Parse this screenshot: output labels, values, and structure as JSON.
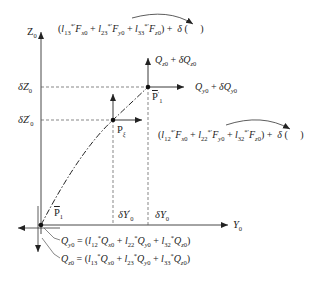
{
  "axes": {
    "vertical_label": "Z",
    "vertical_sub": "0",
    "horizontal_label": "Y",
    "horizontal_sub": "0"
  },
  "z_ticks": [
    {
      "label": "δZ",
      "sub": "0",
      "prime": ""
    },
    {
      "label": "δZ",
      "sub": "0",
      "prime": "′"
    }
  ],
  "y_ticks": [
    {
      "label": "δY",
      "sub": "0",
      "prime": "′"
    },
    {
      "label": "δY",
      "sub": "0",
      "prime": ""
    }
  ],
  "points": {
    "p1": {
      "label": "P",
      "sub": "1",
      "bar": true
    },
    "p1_prime": {
      "label": "P",
      "sub": "1",
      "sup": "′",
      "bar": true
    },
    "p_xi": {
      "label": "P",
      "sub": "ξ",
      "bar": true
    }
  },
  "vectors": {
    "top_q_z": "Q_z0 + δQ_z0",
    "right_q_y": "Q_y0 + δQ_y0"
  },
  "equations": {
    "top": "(l13*′F_x0 + l23*′F_y0 + l33*′F_z0) + δ( )",
    "middle": "(l12*′F_x0 + l22*′F_y0 + l32*′F_z0) + δ( )",
    "bottom_y": "Q_y0 = (l12*Q_x0 + l22*Q_y0 + l32*Q_z0)",
    "bottom_z": "Q_z0 = (l13*Q_x0 + l23*Q_y0 + l33*Q_z0)"
  },
  "colors": {
    "line": "#222222",
    "dashed": "#555555",
    "background": "#ffffff"
  }
}
